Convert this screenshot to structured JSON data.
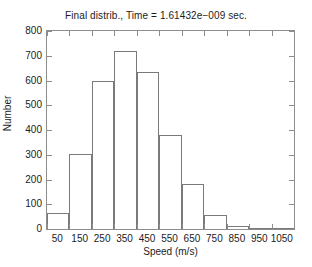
{
  "chart_data": {
    "type": "bar",
    "title": "Final distrib., Time = 1.61432e−009 sec.",
    "xlabel": "Speed (m/s)",
    "ylabel": "Number",
    "grid": false,
    "legend": null,
    "bin_width": 100,
    "bin_edges": [
      0,
      100,
      200,
      300,
      400,
      500,
      600,
      700,
      800,
      900,
      1000,
      1100
    ],
    "categories": [
      "50",
      "150",
      "250",
      "350",
      "450",
      "550",
      "650",
      "750",
      "850",
      "950",
      "1050"
    ],
    "values": [
      65,
      305,
      597,
      720,
      633,
      380,
      183,
      58,
      14,
      3,
      2
    ],
    "xlim": [
      0,
      1100
    ],
    "ylim": [
      0,
      800
    ],
    "xticks": [
      0,
      100,
      200,
      300,
      400,
      500,
      600,
      700,
      800,
      900,
      1000,
      1100
    ],
    "xtick_labels": [
      "50",
      "150",
      "250",
      "350",
      "450",
      "550",
      "650",
      "750",
      "850",
      "950",
      "1050"
    ],
    "xtick_label_positions": [
      50,
      150,
      250,
      350,
      450,
      550,
      650,
      750,
      850,
      950,
      1050
    ],
    "yticks": [
      0,
      100,
      200,
      300,
      400,
      500,
      600,
      700,
      800
    ],
    "ytick_labels": [
      "0",
      "100",
      "200",
      "300",
      "400",
      "500",
      "600",
      "700",
      "800"
    ],
    "colors": {
      "bar_edge": "#7a7a7a",
      "bar_face": "#ffffff",
      "axis": "#8d8d8d",
      "text": "#1c1c1c",
      "background": "#ffffff"
    }
  }
}
